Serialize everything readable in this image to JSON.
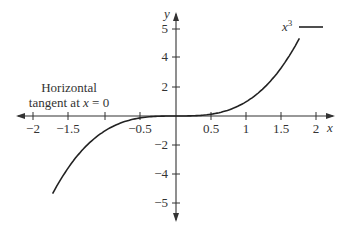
{
  "chart_data": {
    "type": "line",
    "title": "",
    "xlabel": "x",
    "ylabel": "y",
    "xlim": [
      -2.1,
      2.1
    ],
    "ylim": [
      -5.2,
      5.4
    ],
    "grid": false,
    "x_ticks": [
      {
        "value": -2,
        "label": "−2",
        "px": 33
      },
      {
        "value": -1.5,
        "label": "−1.5",
        "px": 68
      },
      {
        "value": -1,
        "label": "",
        "px": 105
      },
      {
        "value": -0.5,
        "label": "−0.5",
        "px": 140
      },
      {
        "value": 0.5,
        "label": "0.5",
        "px": 211
      },
      {
        "value": 1,
        "label": "1",
        "px": 246
      },
      {
        "value": 1.5,
        "label": "1.5",
        "px": 281
      },
      {
        "value": 2,
        "label": "2",
        "px": 316
      }
    ],
    "y_ticks": [
      {
        "value": 5,
        "label": "5",
        "px": 29
      },
      {
        "value": 4,
        "label": "4",
        "px": 57
      },
      {
        "value": 2,
        "label": "2",
        "px": 87
      },
      {
        "value": -2,
        "label": "−2",
        "px": 145
      },
      {
        "value": -4,
        "label": "−4",
        "px": 174
      },
      {
        "value": -5,
        "label": "−5",
        "px": 203
      }
    ],
    "series": [
      {
        "name": "x³",
        "function": "x^3",
        "x": [
          -1.75,
          -1.5,
          -1.25,
          -1,
          -0.75,
          -0.5,
          -0.25,
          0,
          0.25,
          0.5,
          0.75,
          1,
          1.25,
          1.5,
          1.75
        ],
        "values": [
          -5.36,
          -3.375,
          -1.95,
          -1,
          -0.42,
          -0.125,
          -0.016,
          0,
          0.016,
          0.125,
          0.42,
          1,
          1.95,
          3.375,
          5.36
        ]
      }
    ],
    "legend": {
      "entries": [
        "x³"
      ],
      "position": "top-right"
    },
    "annotations": [
      {
        "text_line1": "Horizontal",
        "text_line2_prefix": "tangent at ",
        "text_line2_var": "x",
        "text_line2_suffix": " = 0"
      }
    ]
  }
}
